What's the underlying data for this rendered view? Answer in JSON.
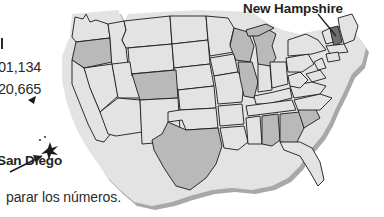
{
  "page": {
    "width": 384,
    "height": 217,
    "background": "#ffffff"
  },
  "stats": {
    "tick_mark": "",
    "value_1": "01,134",
    "value_2": "20,665"
  },
  "callouts": {
    "san_diego": {
      "label": "San Diego",
      "marker": "star-marker",
      "arrow": "arrow-pointer-icon"
    },
    "new_hampshire": {
      "label": "New Hampshire",
      "leader": "leader-line"
    }
  },
  "caption": {
    "text": "parar los números."
  },
  "map": {
    "name": "united-states-map",
    "title": "United States",
    "shading_levels": [
      {
        "name": "light",
        "color": "#e3e3e3"
      },
      {
        "name": "medium",
        "color": "#b9b9b9"
      },
      {
        "name": "dark",
        "color": "#6f6f6f"
      }
    ],
    "outline_color": "#1a1a1a",
    "shadow_color": "#9a9a9a",
    "highlighted_state": "New Hampshire",
    "marked_city": "San Diego"
  }
}
